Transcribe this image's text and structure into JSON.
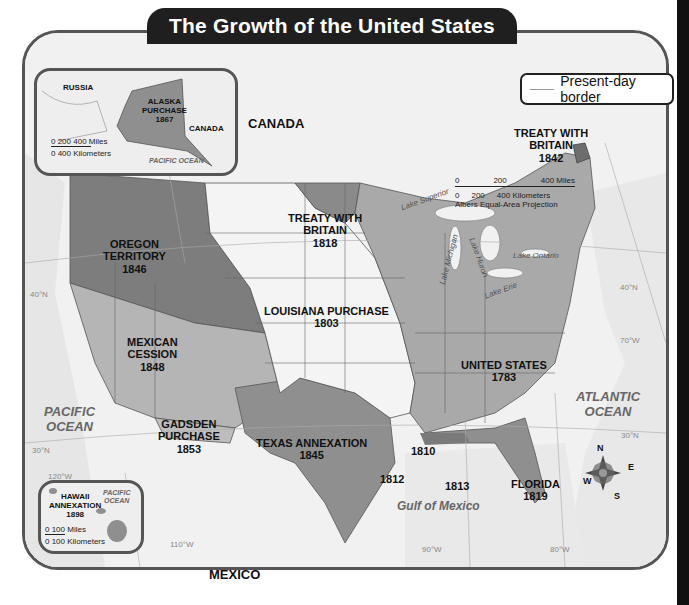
{
  "title": "The Growth of the United States",
  "legend": {
    "label": "Present-day border",
    "line_color": "#999999"
  },
  "regions": [
    {
      "name": "United States",
      "year": "1783",
      "color": "#a9a9a9"
    },
    {
      "name": "Louisiana Purchase",
      "year": "1803",
      "color": "#f2f2f2"
    },
    {
      "name": "Treaty with Britain",
      "year": "1818",
      "color": "#8a8a8a"
    },
    {
      "name": "Florida",
      "year": "1819",
      "color": "#8f8f8f"
    },
    {
      "name": "Texas Annexation",
      "year": "1845",
      "color": "#8f8f8f"
    },
    {
      "name": "Oregon Territory",
      "year": "1846",
      "color": "#7d7d7d"
    },
    {
      "name": "Mexican Cession",
      "year": "1848",
      "color": "#b5b5b5"
    },
    {
      "name": "Gadsden Purchase",
      "year": "1853",
      "color": "#bdbdbd"
    },
    {
      "name": "Treaty with Britain",
      "year": "1842",
      "color": "#6e6e6e"
    },
    {
      "name": "Alaska Purchase",
      "year": "1867",
      "color": "#8f8f8f"
    },
    {
      "name": "Hawaii Annexation",
      "year": "1898",
      "color": "#8f8f8f"
    }
  ],
  "labels": {
    "oregon": [
      "OREGON",
      "TERRITORY",
      "1846"
    ],
    "treaty1818": [
      "TREATY WITH",
      "BRITAIN",
      "1818"
    ],
    "treaty1842": [
      "TREATY WITH",
      "BRITAIN",
      "1842"
    ],
    "louisiana": [
      "LOUISIANA PURCHASE",
      "1803"
    ],
    "mexican": [
      "MEXICAN",
      "CESSION",
      "1848"
    ],
    "gadsden": [
      "GADSDEN",
      "PURCHASE",
      "1853"
    ],
    "texas": [
      "TEXAS ANNEXATION",
      "1845"
    ],
    "us1783": [
      "UNITED STATES",
      "1783"
    ],
    "florida": [
      "FLORIDA",
      "1819"
    ],
    "y1810": "1810",
    "y1812": "1812",
    "y1813": "1813",
    "canada": "CANADA",
    "mexico": "MEXICO"
  },
  "water": {
    "pacific": [
      "PACIFIC",
      "OCEAN"
    ],
    "atlantic": [
      "ATLANTIC",
      "OCEAN"
    ],
    "gulf": "Gulf of Mexico",
    "lakes": [
      "Lake Superior",
      "Lake Michigan",
      "Lake Huron",
      "Lake Ontario",
      "Lake Erie"
    ]
  },
  "coordinates": {
    "lat40_w": "40°N",
    "lat40_e": "40°N",
    "lat30_w": "30°N",
    "lat30_e": "30°N",
    "lon120": "120°W",
    "lon110": "110°W",
    "lon90": "90°W",
    "lon80": "80°W",
    "lon70": "70°W"
  },
  "scale_main": {
    "miles": [
      "0",
      "200",
      "400 Miles"
    ],
    "km": [
      "0",
      "200",
      "400 Kilometers"
    ],
    "projection": "Albers Equal-Area Projection"
  },
  "alaska_inset": {
    "russia": "RUSSIA",
    "canada": "CANADA",
    "label": [
      "ALASKA",
      "PURCHASE",
      "1867"
    ],
    "ocean": "PACIFIC OCEAN",
    "scale_miles": "0   200  400 Miles",
    "scale_km": "0       400 Kilometers"
  },
  "hawaii_inset": {
    "label": [
      "HAWAII",
      "ANNEXATION",
      "1898"
    ],
    "ocean": [
      "PACIFIC",
      "OCEAN"
    ],
    "scale_miles": "0       100 Miles",
    "scale_km": "0   100 Kilometers"
  },
  "compass": {
    "n": "N",
    "e": "E",
    "s": "S",
    "w": "W"
  }
}
